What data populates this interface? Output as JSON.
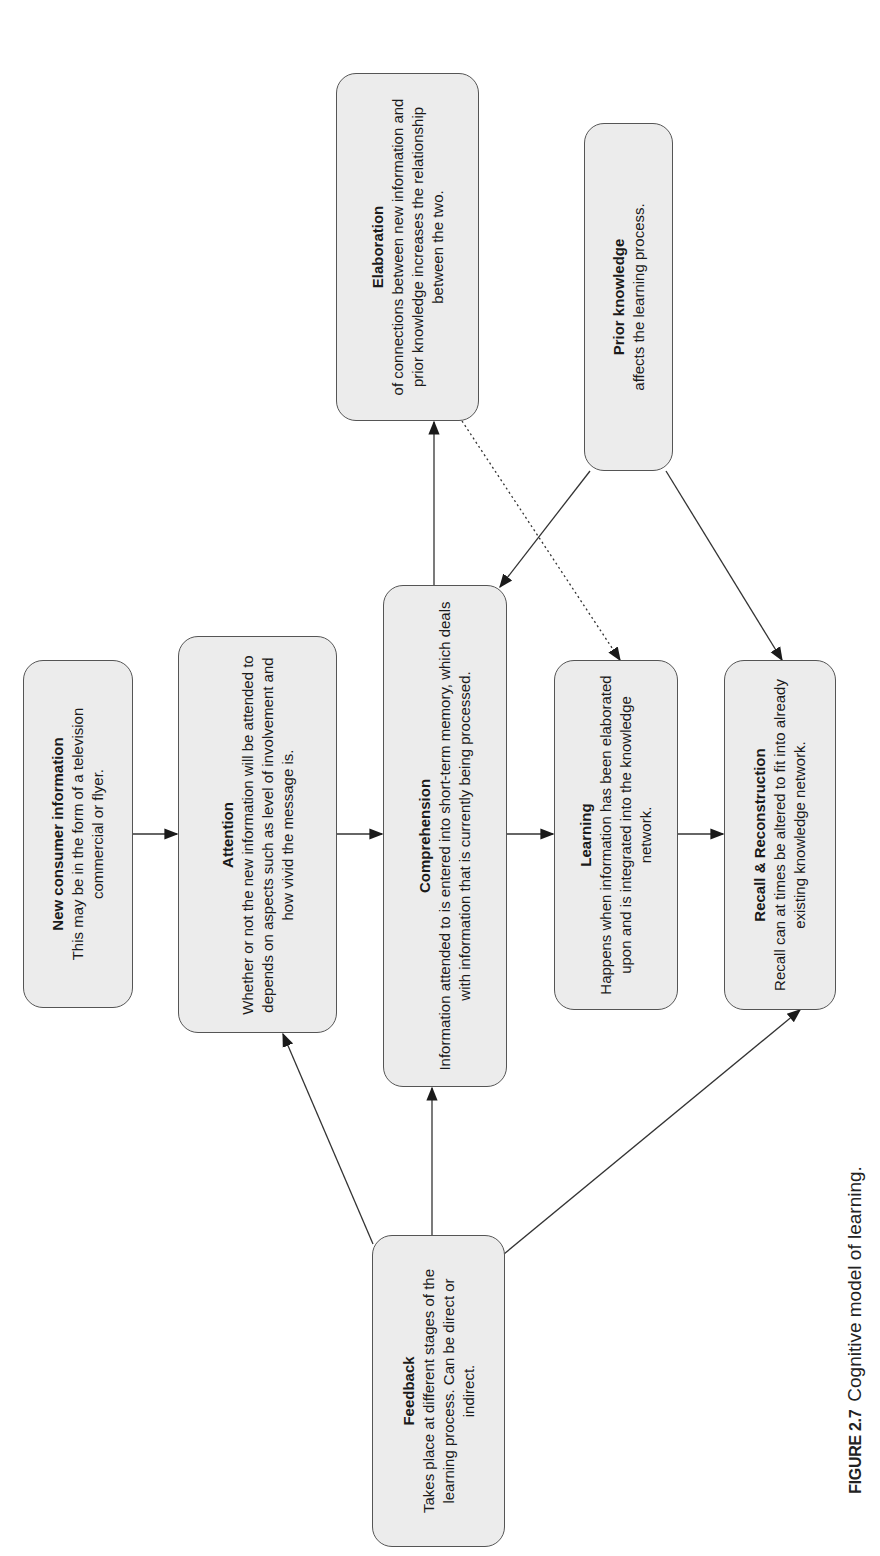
{
  "diagram": {
    "orientation": "rotated-90-ccw",
    "colors": {
      "box_fill": "#ececec",
      "box_border": "#555555",
      "arrow": "#333333",
      "text": "#1a1a1a"
    },
    "nodes": {
      "new_info": {
        "title": "New consumer information",
        "body": "This may be in the form of a television commercial or flyer."
      },
      "attention": {
        "title": "Attention",
        "body": "Whether or not the new information will be attended to depends on aspects such as level of involvement and how vivid the message is."
      },
      "comprehension": {
        "title": "Comprehension",
        "body": "Information attended to is entered into short-term memory, which deals with information that is currently being processed."
      },
      "learning": {
        "title": "Learning",
        "body": "Happens when information has been elaborated upon and is integrated into the knowledge network."
      },
      "recall": {
        "title": "Recall & Reconstruction",
        "body": "Recall can at times be altered to fit into already existing knowledge network."
      },
      "elaboration": {
        "title": "Elaboration",
        "body": "of connections between new information and prior knowledge increases the relationship between the two."
      },
      "prior_knowledge": {
        "title": "Prior knowledge",
        "body": "affects the learning process."
      },
      "feedback": {
        "title": "Feedback",
        "body": "Takes place at different stages of the learning process. Can be direct or indirect."
      }
    },
    "edges": [
      {
        "from": "New consumer information",
        "to": "Attention",
        "style": "solid"
      },
      {
        "from": "Attention",
        "to": "Comprehension",
        "style": "solid"
      },
      {
        "from": "Comprehension",
        "to": "Learning",
        "style": "solid"
      },
      {
        "from": "Learning",
        "to": "Recall & Reconstruction",
        "style": "solid"
      },
      {
        "from": "Comprehension",
        "to": "Elaboration",
        "style": "solid"
      },
      {
        "from": "Elaboration",
        "to": "Learning",
        "style": "dotted"
      },
      {
        "from": "Prior knowledge",
        "to": "Comprehension",
        "style": "solid"
      },
      {
        "from": "Prior knowledge",
        "to": "Recall & Reconstruction",
        "style": "solid"
      },
      {
        "from": "Feedback",
        "to": "Attention",
        "style": "solid"
      },
      {
        "from": "Feedback",
        "to": "Comprehension",
        "style": "solid"
      },
      {
        "from": "Feedback",
        "to": "Recall & Reconstruction",
        "style": "solid"
      }
    ]
  },
  "caption": {
    "label": "FIGURE 2.7",
    "text": "Cognitive model of learning."
  }
}
